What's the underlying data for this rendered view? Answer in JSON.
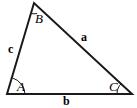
{
  "figure": {
    "type": "geometry-diagram",
    "shape": "triangle",
    "background_color": "#ffffff",
    "stroke_color": "#1a1a1a",
    "stroke_width": 2,
    "arc_stroke_width": 1,
    "width": 137,
    "height": 108,
    "vertices": [
      {
        "name": "A",
        "label": "A",
        "x": 7,
        "y": 94,
        "position": "bottom-left"
      },
      {
        "name": "B",
        "label": "B",
        "x": 34,
        "y": 3,
        "position": "apex-top"
      },
      {
        "name": "C",
        "label": "C",
        "x": 132,
        "y": 94,
        "position": "bottom-right"
      }
    ],
    "edges": [
      {
        "name": "side-a",
        "label": "a",
        "from": "B",
        "to": "C",
        "opposite_vertex": "A",
        "style": "bold-italic-none"
      },
      {
        "name": "side-b",
        "label": "b",
        "from": "A",
        "to": "C",
        "opposite_vertex": "B",
        "style": "bold-italic-none"
      },
      {
        "name": "side-c",
        "label": "c",
        "from": "A",
        "to": "B",
        "opposite_vertex": "C",
        "style": "bold-italic-none"
      }
    ],
    "angle_arcs": [
      {
        "name": "angle-arc-A",
        "at_vertex": "A"
      },
      {
        "name": "angle-arc-B",
        "at_vertex": "B"
      },
      {
        "name": "angle-arc-C",
        "at_vertex": "C"
      }
    ],
    "labels": {
      "vertex_A": "A",
      "vertex_B": "B",
      "vertex_C": "C",
      "side_a": "a",
      "side_b": "b",
      "side_c": "c"
    }
  }
}
